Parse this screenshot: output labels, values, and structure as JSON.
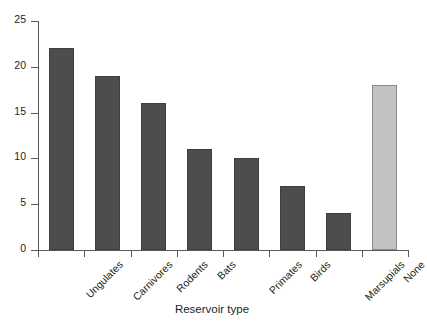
{
  "chart_data": {
    "type": "bar",
    "title": "",
    "xlabel": "Reservoir type",
    "ylabel": "",
    "categories": [
      "Ungulates",
      "Carnivores",
      "Rodents",
      "Bats",
      "Primates",
      "Birds",
      "Marsupials",
      "None"
    ],
    "values": [
      22,
      19,
      16,
      11,
      10,
      7,
      4,
      18
    ],
    "ylim": [
      0,
      25
    ],
    "yticks": [
      0,
      5,
      10,
      15,
      20,
      25
    ],
    "ytick_labels": [
      "0",
      "5",
      "10",
      "15",
      "20",
      "25"
    ],
    "grid": false,
    "legend": null,
    "bar_colors": [
      "#4d4d4d",
      "#4d4d4d",
      "#4d4d4d",
      "#4d4d4d",
      "#4d4d4d",
      "#4d4d4d",
      "#4d4d4d",
      "#c2c2c2"
    ],
    "bar_edge_colors": [
      "#3f3f3f",
      "#3f3f3f",
      "#3f3f3f",
      "#3f3f3f",
      "#3f3f3f",
      "#3f3f3f",
      "#3f3f3f",
      "#8a8a8a"
    ],
    "axis_color": "#58595b",
    "text_color": "#231f20",
    "background": "#ffffff",
    "category_label_rotation": -45
  }
}
